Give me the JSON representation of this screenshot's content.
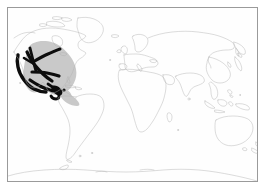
{
  "figure": {
    "kind": "distribution-map",
    "title": "",
    "caption": "",
    "background_color": "#ffffff",
    "frame": {
      "present": true,
      "line_color": "#9a9a9a",
      "line_width_px": 1,
      "x": 7,
      "y": 7,
      "width": 251,
      "height": 175
    }
  },
  "map": {
    "projection_note": "equirectangular world map, full globe",
    "coastline_color": "#b0b0b0",
    "coastline_width_px": 0.45,
    "ocean_color": "#fefefe",
    "land_fill": "none",
    "labels": [],
    "graticule": false,
    "landmasses": [
      "North America",
      "Greenland",
      "Canadian Arctic Archipelago",
      "South America",
      "Europe",
      "Africa",
      "Asia",
      "Southeast Asian archipelago",
      "Australia",
      "Tasmania",
      "New Zealand",
      "Japan",
      "British Isles",
      "Madagascar",
      "Antarctica"
    ]
  },
  "range": {
    "shade": {
      "label": "broader range extent",
      "color": "#c9c9c9",
      "region_description": "North America east to the Atlantic seaboard, Mexico, Central America and northern South America"
    },
    "core": {
      "label": "core distribution",
      "color": "#0d0d0d",
      "region_description": "branching bands through western North America, the Rocky Mountains, the Great Lakes area, Mexico and Central America"
    }
  },
  "legend": {
    "present": false,
    "entries": []
  }
}
